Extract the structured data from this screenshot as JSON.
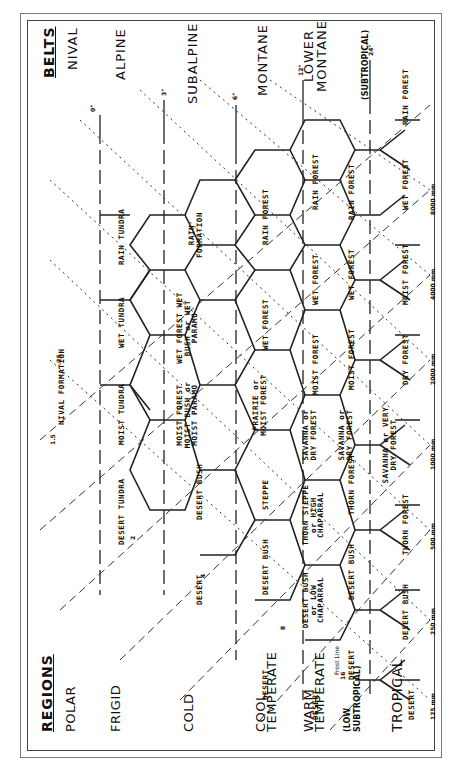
{
  "headers": {
    "belts": "BELTS",
    "regions": "REGIONS"
  },
  "belts": [
    "NIVAL",
    "ALPINE",
    "SUBALPINE",
    "MONTANE",
    "LOWER MONTANE",
    "(SUBTROPICAL)"
  ],
  "regions": [
    "POLAR",
    "FRIGID",
    "COLD",
    "COOL TEMPERATE",
    "WARM TEMPERATE",
    "(LOW SUBTROPICAL)",
    "TROPICAL"
  ],
  "nival": "NIVAL FORMATION",
  "frost_line": "Frost Line",
  "precip": [
    "125 mm",
    "250 mm",
    "500 mm",
    "1000 mm",
    "2000 mm",
    "4000 mm",
    "8000 mm"
  ],
  "temps": [
    "1.5",
    ".25",
    "0°",
    "3°",
    "6°",
    "12°",
    "24°",
    "2",
    "4",
    "8",
    "16"
  ],
  "cells": {
    "alpine": [
      "DESERT TUNDRA",
      "MOIST TUNDRA",
      "WET TUNDRA",
      "RAIN TUNDRA"
    ],
    "subalpine": [
      "DESERT",
      "DESERT BUSH",
      "MOIST FOREST MOIST BUSH or MOIST PARAMO",
      "WET FOREST WET BUSH or WET PARAMO",
      "RAIN FORMATION"
    ],
    "montane": [
      "DESERT",
      "DESERT BUSH",
      "STEPPE",
      "PRAIRIE or MOIST FOREST",
      "WET FOREST",
      "RAIN FOREST"
    ],
    "lower_montane": [
      "DESERT",
      "DESERT BUSH or LOW CHAPARRAL",
      "THORN STEPPE or HIGH CHAPARRAL",
      "SAVANNA or DRY FOREST",
      "MOIST FOREST",
      "WET FOREST",
      "RAIN FOREST"
    ],
    "subtropical": [
      "DESERT",
      "DESERT BUSH",
      "THORN FOREST",
      "SAVANNA or DRY FOREST",
      "MOIST FOREST",
      "WET FOREST",
      "RAIN FOREST"
    ],
    "tropical": [
      "DESERT",
      "DESERT BUSH",
      "THORN FOREST",
      "SAVANNA or VERY DRY FOREST",
      "DRY FOREST",
      "MOIST FOREST",
      "WET FOREST",
      "RAIN FOREST"
    ]
  },
  "colors": {
    "ink": "#111111",
    "background": "#ffffff"
  }
}
